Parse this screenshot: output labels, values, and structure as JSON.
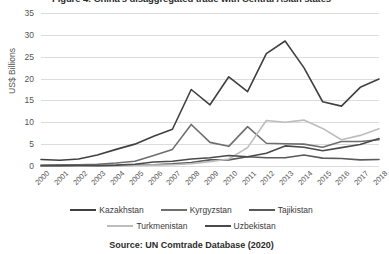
{
  "figure": {
    "title": "Figure 4: China's disaggregated trade with Central Asian states",
    "source": "Source: UN Comtrade Database (2020)"
  },
  "chart_data": {
    "type": "line",
    "title": "Figure 4: China's disaggregated trade with Central Asian states",
    "xlabel": "",
    "ylabel": "US$ Billions",
    "ylim": [
      0,
      35
    ],
    "yticks": [
      0,
      5,
      10,
      15,
      20,
      25,
      30,
      35
    ],
    "ytick_labels": [
      "0",
      "5",
      "10",
      "15",
      "20",
      "25",
      "30",
      "35"
    ],
    "grid": true,
    "legend_position": "bottom",
    "categories": [
      "2000",
      "2001",
      "2002",
      "2003",
      "2004",
      "2005",
      "2006",
      "2007",
      "2008",
      "2009",
      "2010",
      "2011",
      "2012",
      "2013",
      "2014",
      "2015",
      "2016",
      "2017",
      "2018"
    ],
    "series": [
      {
        "name": "Kazakhstan",
        "color": "#404040",
        "values": [
          1.5,
          1.3,
          1.6,
          2.5,
          3.8,
          5.0,
          6.8,
          8.4,
          17.5,
          14.0,
          20.4,
          17.0,
          25.7,
          28.6,
          22.5,
          14.7,
          13.7,
          18.0,
          19.9
        ]
      },
      {
        "name": "Kyrgyzstan",
        "color": "#6e6e6e",
        "values": [
          0.2,
          0.3,
          0.3,
          0.4,
          0.7,
          1.1,
          2.4,
          3.8,
          9.5,
          5.4,
          4.5,
          9.0,
          5.2,
          5.1,
          5.0,
          4.3,
          5.6,
          5.6,
          6.0
        ]
      },
      {
        "name": "Tajikistan",
        "color": "#5a5a5a",
        "values": [
          0.02,
          0.03,
          0.05,
          0.04,
          0.1,
          0.2,
          0.3,
          0.5,
          0.8,
          1.4,
          1.4,
          2.1,
          1.9,
          1.9,
          2.5,
          1.8,
          1.7,
          1.4,
          1.5
        ]
      },
      {
        "name": "Turkmenistan",
        "color": "#bdbdbd",
        "values": [
          0.02,
          0.03,
          0.04,
          0.06,
          0.1,
          0.1,
          0.2,
          0.3,
          0.5,
          1.0,
          1.6,
          4.2,
          10.4,
          10.0,
          10.5,
          8.6,
          6.0,
          7.0,
          8.5
        ]
      },
      {
        "name": "Uzbekistan",
        "color": "#4a4a4a",
        "values": [
          0.05,
          0.06,
          0.1,
          0.1,
          0.2,
          0.4,
          0.9,
          1.1,
          1.6,
          1.9,
          2.4,
          2.1,
          2.9,
          4.6,
          4.3,
          3.5,
          4.2,
          4.9,
          6.3
        ]
      }
    ]
  },
  "legend": {
    "rows": [
      [
        "Kazakhstan",
        "Kyrgyzstan",
        "Tajikistan"
      ],
      [
        "Turkmenistan",
        "Uzbekistan"
      ]
    ]
  }
}
